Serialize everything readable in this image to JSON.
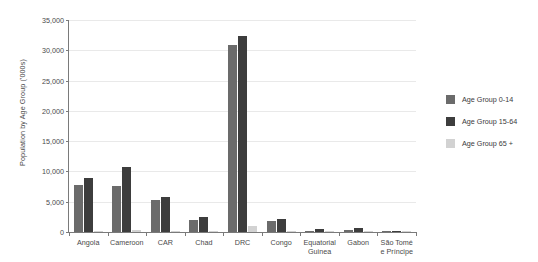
{
  "chart_data": {
    "type": "bar",
    "title": "",
    "xlabel": "",
    "ylabel": "Population by Age Group ('000s)",
    "ylim": [
      0,
      35000
    ],
    "ytick_step": 5000,
    "ytick_labels": [
      "0",
      "5,000",
      "10,000",
      "15,000",
      "20,000",
      "25,000",
      "30,000",
      "35,000"
    ],
    "ytick_values": [
      0,
      5000,
      10000,
      15000,
      20000,
      25000,
      30000,
      35000
    ],
    "grid": true,
    "legend_position": "right",
    "categories": [
      "Angola",
      "Cameroon",
      "CAR",
      "Chad",
      "DRC",
      "Congo",
      "Equatorial Guinea",
      "Gabon",
      "São Tomé e Príncipe"
    ],
    "series": [
      {
        "name": "Age Group 0-14",
        "color": "#6b6b6b",
        "values": [
          7800,
          7600,
          5300,
          2050,
          30800,
          1800,
          250,
          350,
          80
        ]
      },
      {
        "name": "Age Group 15-64",
        "color": "#3d3d3d",
        "values": [
          9000,
          10700,
          5700,
          2450,
          32300,
          2100,
          450,
          650,
          110
        ]
      },
      {
        "name": "Age Group 65 +",
        "color": "#d2d2d2",
        "values": [
          180,
          400,
          170,
          120,
          1000,
          130,
          20,
          50,
          10
        ]
      }
    ]
  },
  "legend": {
    "items": [
      {
        "label": "Age Group 0-14",
        "color": "#6b6b6b"
      },
      {
        "label": "Age Group 15-64",
        "color": "#3d3d3d"
      },
      {
        "label": "Age Group 65 +",
        "color": "#d2d2d2"
      }
    ]
  }
}
